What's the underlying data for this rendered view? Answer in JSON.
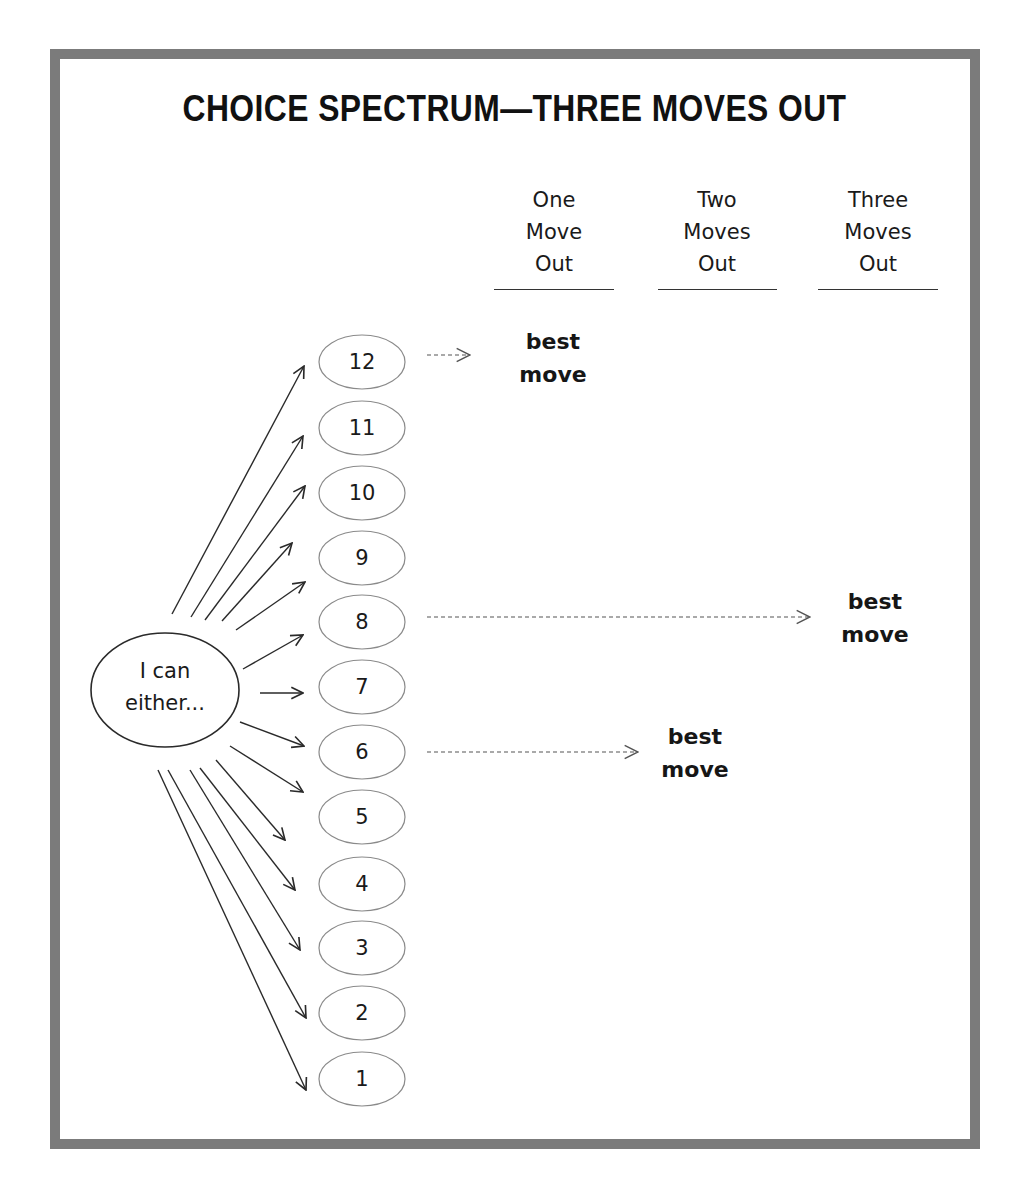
{
  "title": "CHOICE SPECTRUM—THREE MOVES OUT",
  "columns": [
    {
      "lines": [
        "One",
        "Move",
        "Out"
      ]
    },
    {
      "lines": [
        "Two",
        "Moves",
        "Out"
      ]
    },
    {
      "lines": [
        "Three",
        "Moves",
        "Out"
      ]
    }
  ],
  "origin": {
    "lines": [
      "I can",
      "either..."
    ]
  },
  "options": [
    "12",
    "11",
    "10",
    "9",
    "8",
    "7",
    "6",
    "5",
    "4",
    "3",
    "2",
    "1"
  ],
  "best_moves": [
    {
      "from_option": "12",
      "column": "One Move Out",
      "lines": [
        "best",
        "move"
      ]
    },
    {
      "from_option": "8",
      "column": "Three Moves Out",
      "lines": [
        "best",
        "move"
      ]
    },
    {
      "from_option": "6",
      "column": "Two Moves Out",
      "lines": [
        "best",
        "move"
      ]
    }
  ],
  "colors": {
    "frame": "#7b7b7b",
    "ink": "#1a1a1a",
    "background": "#ffffff"
  }
}
